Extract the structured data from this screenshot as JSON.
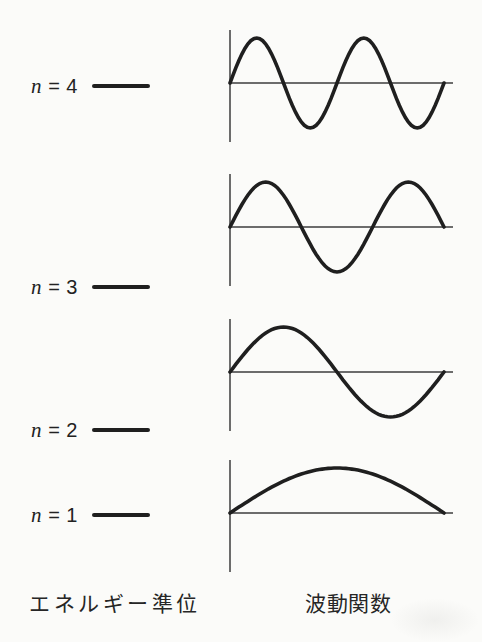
{
  "captions": {
    "left": "エネルギー準位",
    "right": "波動関数"
  },
  "energy_levels": [
    {
      "n": 4,
      "label_symbol": "n",
      "label_rest": " = 4",
      "y": 86
    },
    {
      "n": 3,
      "label_symbol": "n",
      "label_rest": " = 3",
      "y": 287
    },
    {
      "n": 2,
      "label_symbol": "n",
      "label_rest": " = 2",
      "y": 430
    },
    {
      "n": 1,
      "label_symbol": "n",
      "label_rest": " = 1",
      "y": 515
    }
  ],
  "wavefunctions": [
    {
      "n": 4,
      "half_waves": 4,
      "axis_y": 83
    },
    {
      "n": 3,
      "half_waves": 3,
      "axis_y": 227
    },
    {
      "n": 2,
      "half_waves": 2,
      "axis_y": 372
    },
    {
      "n": 1,
      "half_waves": 1,
      "axis_y": 513
    }
  ],
  "colors": {
    "ink": "#1f1f1f",
    "axis": "#3c3c3c",
    "background": "#fbfbf9"
  }
}
